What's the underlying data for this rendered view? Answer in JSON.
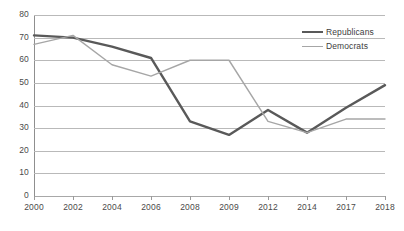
{
  "chart_data": {
    "type": "line",
    "title": "",
    "subtitle": "",
    "xlabel": "",
    "ylabel": "",
    "categories": [
      "2000",
      "2002",
      "2004",
      "2006",
      "2008",
      "2009",
      "2012",
      "2014",
      "2017",
      "2018"
    ],
    "series": [
      {
        "name": "Republicans",
        "color": "#595959",
        "values": [
          71,
          70,
          66,
          61,
          33,
          27,
          38,
          28,
          39,
          49
        ]
      },
      {
        "name": "Democrats",
        "color": "#a6a6a6",
        "values": [
          67,
          71,
          58,
          53,
          60,
          60,
          33,
          28,
          34,
          34
        ]
      }
    ],
    "ylim": [
      0,
      80
    ],
    "y_ticks": [
      "0",
      "10",
      "20",
      "30",
      "40",
      "50",
      "60",
      "70",
      "80"
    ],
    "grid": true,
    "grid_axis": "y",
    "legend_position": "top-right",
    "annotations": []
  },
  "legend": {
    "items": [
      {
        "label": "Republicans",
        "swatch": "line-swatch-dark"
      },
      {
        "label": "Democrats",
        "swatch": "line-swatch-light"
      }
    ]
  },
  "colors": {
    "republicans": "#595959",
    "democrats": "#a6a6a6",
    "gridline": "#b9b9b9",
    "axis": "#8f8f8f",
    "text": "#4a4a4a",
    "background": "#ffffff"
  }
}
